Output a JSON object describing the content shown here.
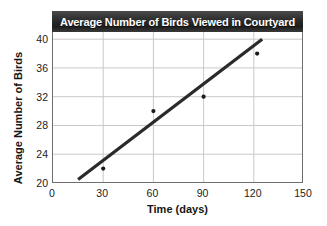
{
  "chart_data": {
    "type": "scatter",
    "title": "Average Number of Birds Viewed in Courtyard",
    "xlabel": "Time (days)",
    "ylabel": "Average Number of Birds",
    "xlim": [
      0,
      150
    ],
    "ylim": [
      20,
      41
    ],
    "xticks": [
      0,
      30,
      60,
      90,
      120,
      150
    ],
    "yticks": [
      20,
      24,
      28,
      32,
      36,
      40
    ],
    "xtick_labels": [
      "0",
      "30",
      "60",
      "90",
      "120",
      "150"
    ],
    "ytick_labels": [
      "20",
      "24",
      "28",
      "32",
      "36",
      "40"
    ],
    "grid": true,
    "legend": "none",
    "points": [
      {
        "x": 30,
        "y": 22
      },
      {
        "x": 60,
        "y": 30
      },
      {
        "x": 90,
        "y": 32
      },
      {
        "x": 122,
        "y": 38
      }
    ],
    "trend_line": {
      "x0": 15,
      "y0": 20.5,
      "x1": 125,
      "y1": 40.0
    },
    "colors": {
      "title_band": "#2b2b2b",
      "title_text": "#ffffff",
      "grid": "#c9c9c9",
      "axis_border": "#6e6e6e",
      "marker": "#1a1a1a",
      "trend_line": "#2a2a2a",
      "tick_text": "#1c1c1c",
      "background": "#ffffff"
    }
  }
}
